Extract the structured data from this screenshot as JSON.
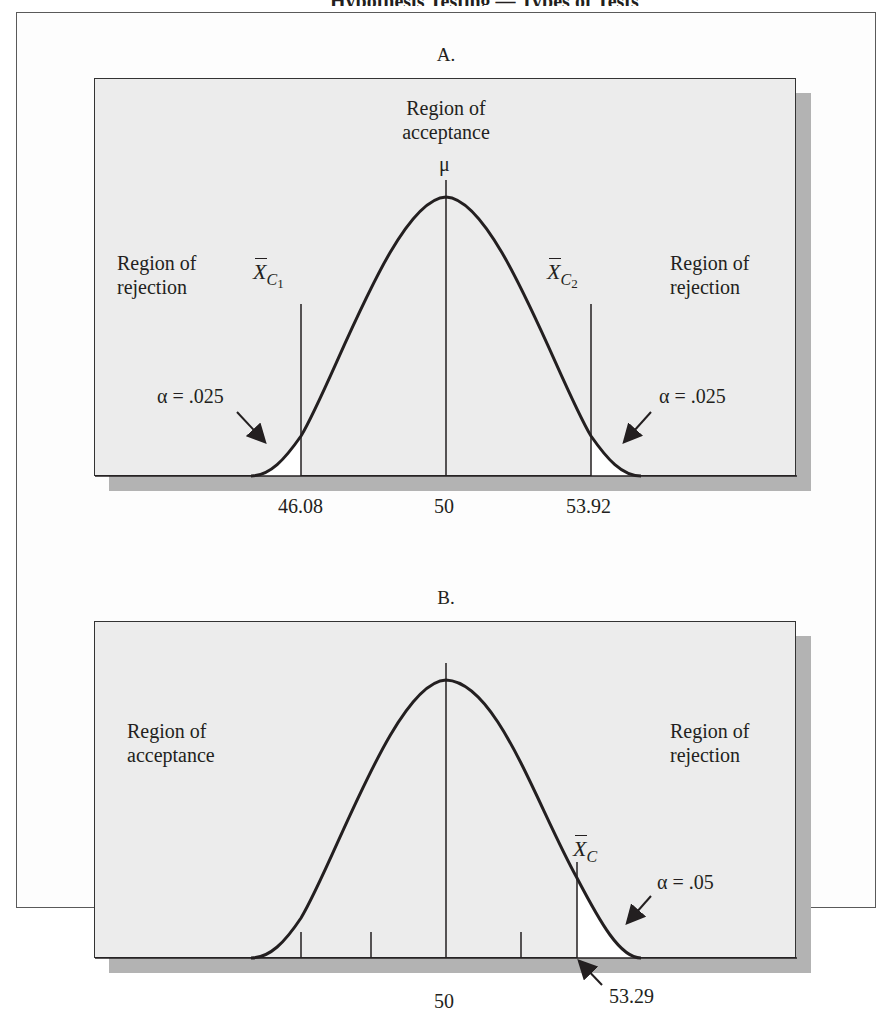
{
  "page": {
    "cut_heading": "Hypothesis Testing — Types of Tests"
  },
  "panel_a": {
    "title": "A.",
    "center_label_line1": "Region of",
    "center_label_line2": "acceptance",
    "mu_label": "μ",
    "left_label_line1": "Region of",
    "left_label_line2": "rejection",
    "right_label_line1": "Region of",
    "right_label_line2": "rejection",
    "xc1_symbol": "X",
    "xc1_sub": "C",
    "xc1_subsub": "1",
    "xc2_symbol": "X",
    "xc2_sub": "C",
    "xc2_subsub": "2",
    "alpha_left": "α = .025",
    "alpha_right": "α = .025",
    "tick_left": "46.08",
    "tick_center": "50",
    "tick_right": "53.92"
  },
  "panel_b": {
    "title": "B.",
    "left_label_line1": "Region of",
    "left_label_line2": "acceptance",
    "right_label_line1": "Region of",
    "right_label_line2": "rejection",
    "xc_symbol": "X",
    "xc_sub": "C",
    "alpha": "α = .05",
    "tick_center": "50",
    "tick_critical": "53.29"
  },
  "colors": {
    "panel_fill": "#ececec",
    "shadow": "#b3b3b3",
    "ink": "#231f20",
    "rejection_fill": "#ffffff"
  }
}
